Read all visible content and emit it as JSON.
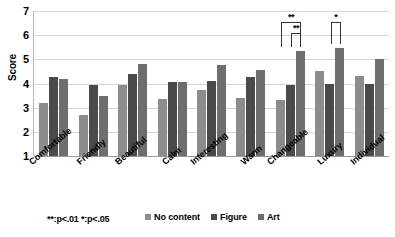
{
  "chart_data": {
    "type": "bar",
    "title": "",
    "xlabel": "",
    "ylabel": "Score",
    "ylim": [
      1,
      7
    ],
    "yticks": [
      1,
      2,
      3,
      4,
      5,
      6,
      7
    ],
    "grid": true,
    "legend_position": "bottom",
    "categories": [
      "Comfortable",
      "Friendly",
      "Beautiful",
      "Calm",
      "Interesting",
      "Warm",
      "Changeable",
      "Luxury",
      "Individual"
    ],
    "series": [
      {
        "name": "No content",
        "color": "#8c8c8c",
        "values": [
          3.2,
          2.7,
          3.95,
          3.35,
          3.75,
          3.4,
          3.3,
          4.5,
          4.3
        ]
      },
      {
        "name": "Figure",
        "color": "#4a4a4a",
        "values": [
          4.25,
          3.95,
          4.4,
          4.05,
          4.1,
          4.25,
          3.95,
          4.0,
          4.0
        ]
      },
      {
        "name": "Art",
        "color": "#6e6e6e",
        "values": [
          4.2,
          3.5,
          4.8,
          4.05,
          4.75,
          4.55,
          5.35,
          5.45,
          5.0
        ]
      }
    ],
    "annotations": [
      {
        "id": "changeable-outer",
        "category": "Changeable",
        "from_series": "No content",
        "to_series": "Art",
        "label": "**",
        "level": "outer"
      },
      {
        "id": "changeable-inner",
        "category": "Changeable",
        "from_series": "Figure",
        "to_series": "Art",
        "label": "**",
        "level": "inner"
      },
      {
        "id": "luxury-bracket",
        "category": "Luxury",
        "from_series": "Figure",
        "to_series": "Art",
        "label": "*",
        "level": "outer"
      }
    ]
  },
  "footnote": {
    "significance_note": "**:p<.01  *:p<.05"
  },
  "legend": {
    "items": [
      {
        "label": "No content",
        "color": "#8c8c8c"
      },
      {
        "label": "Figure",
        "color": "#4a4a4a"
      },
      {
        "label": "Art",
        "color": "#6e6e6e"
      }
    ]
  }
}
